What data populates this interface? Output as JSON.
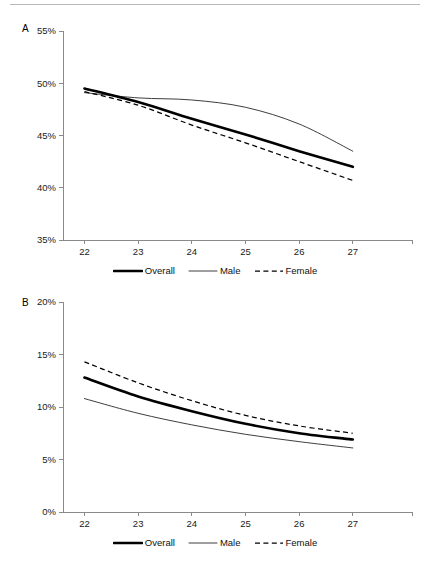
{
  "figure": {
    "background": "#ffffff",
    "rule_color": "#b8b8b8",
    "axis_color": "#8a8a8a"
  },
  "legend": {
    "entries": [
      {
        "label": "Overall",
        "style": "thick-solid",
        "color": "#000000"
      },
      {
        "label": "Male",
        "style": "thin-solid",
        "color": "#1a1a1a"
      },
      {
        "label": "Female",
        "style": "dashed",
        "color": "#000000"
      }
    ]
  },
  "chart_data": [
    {
      "type": "line",
      "panel": "A",
      "panel_label": "A",
      "title": "",
      "xlabel": "",
      "ylabel": "",
      "x": [
        22,
        23,
        24,
        25,
        26,
        27
      ],
      "xlim": [
        21.6,
        27.6
      ],
      "ylim": [
        35,
        55
      ],
      "yticks": [
        35,
        40,
        45,
        50,
        55
      ],
      "ytick_labels": [
        "35%",
        "40%",
        "45%",
        "50%",
        "55%"
      ],
      "xticks": [
        22,
        23,
        24,
        25,
        26,
        27
      ],
      "xtick_labels": [
        "22",
        "23",
        "24",
        "25",
        "26",
        "27"
      ],
      "grid": false,
      "legend_position": "bottom-center",
      "series": [
        {
          "name": "Overall",
          "style": "thick-solid",
          "values": [
            49.5,
            48.2,
            46.6,
            45.1,
            43.5,
            42.0
          ]
        },
        {
          "name": "Male",
          "style": "thin-solid",
          "values": [
            49.1,
            48.6,
            48.4,
            47.7,
            46.1,
            43.5
          ]
        },
        {
          "name": "Female",
          "style": "dashed",
          "values": [
            49.2,
            47.9,
            46.0,
            44.3,
            42.5,
            40.7
          ]
        }
      ]
    },
    {
      "type": "line",
      "panel": "B",
      "panel_label": "B",
      "title": "",
      "xlabel": "",
      "ylabel": "",
      "x": [
        22,
        23,
        24,
        25,
        26,
        27
      ],
      "xlim": [
        21.6,
        27.6
      ],
      "ylim": [
        0,
        20
      ],
      "yticks": [
        0,
        5,
        10,
        15,
        20
      ],
      "ytick_labels": [
        "0%",
        "5%",
        "10%",
        "15%",
        "20%"
      ],
      "xticks": [
        22,
        23,
        24,
        25,
        26,
        27
      ],
      "xtick_labels": [
        "22",
        "23",
        "24",
        "25",
        "26",
        "27"
      ],
      "grid": false,
      "legend_position": "bottom-center",
      "series": [
        {
          "name": "Overall",
          "style": "thick-solid",
          "values": [
            12.8,
            11.0,
            9.6,
            8.4,
            7.5,
            6.9
          ]
        },
        {
          "name": "Male",
          "style": "thin-solid",
          "values": [
            10.8,
            9.4,
            8.3,
            7.4,
            6.7,
            6.1
          ]
        },
        {
          "name": "Female",
          "style": "dashed",
          "values": [
            14.3,
            12.3,
            10.6,
            9.2,
            8.2,
            7.5
          ]
        }
      ]
    }
  ]
}
